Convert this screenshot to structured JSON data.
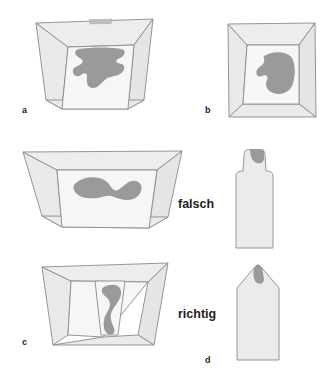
{
  "figure": {
    "language": "de",
    "background_color": "#ffffff",
    "palette": {
      "block_fill": "#e9e9e9",
      "block_fill_light": "#f0f0f0",
      "block_fill_dark": "#e2e2e2",
      "block_fill_inner": "#f5f5f5",
      "outline": "#8a8a8a",
      "specimen_fill": "#9a9a9a",
      "text_color": "#221f20"
    },
    "panels": [
      {
        "id": "a",
        "label": "a",
        "label_x": 22,
        "label_y": 113,
        "shape": "trapezoid-mold-top-view",
        "specimen": "large-irregular-blob",
        "specimen_fill": "#9a9a9a"
      },
      {
        "id": "b",
        "label": "b",
        "label_x": 205,
        "label_y": 113,
        "shape": "trapezoid-mold-top-view",
        "specimen": "rounded-kidney-blob",
        "specimen_fill": "#9a9a9a"
      },
      {
        "id": "c",
        "label": "c",
        "label_x": 22,
        "label_y": 345,
        "shape": "trapezoid-mold-top-view",
        "specimen": "narrow-vertical-sinuous-blob",
        "specimen_fill": "#9a9a9a"
      },
      {
        "id": "d",
        "label": "d",
        "label_x": 205,
        "label_y": 363,
        "shape": "pentagon-section-profile",
        "specimen": "small-notch-blob",
        "specimen_fill": "#9a9a9a"
      }
    ],
    "middle_panel": {
      "id": "middle-left",
      "shape": "wide-trapezoid-mold-top-view",
      "specimen": "wide-flat-blob",
      "specimen_fill": "#9a9a9a"
    },
    "middle_right_panel": {
      "id": "middle-right",
      "shape": "bottle-section-profile",
      "specimen": "small-neck-blob",
      "specimen_fill": "#9a9a9a"
    },
    "verdicts": [
      {
        "id": "falsch",
        "text": "falsch",
        "x": 178,
        "y": 208,
        "meaning": "wrong"
      },
      {
        "id": "richtig",
        "text": "richtig",
        "x": 178,
        "y": 318,
        "meaning": "correct"
      }
    ]
  }
}
